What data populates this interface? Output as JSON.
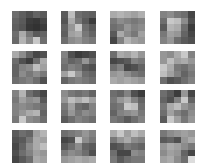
{
  "figure": {
    "rows": 4,
    "cols": 4,
    "tile_grid": [
      5,
      5
    ],
    "background": "#ffffff",
    "tile_positions": {
      "x": [
        12,
        61,
        110,
        160
      ],
      "y": [
        11,
        51,
        90,
        130
      ]
    },
    "tiles": [
      [
        [
          110,
          95,
          80,
          100,
          90
        ],
        [
          100,
          90,
          60,
          55,
          70
        ],
        [
          95,
          85,
          55,
          50,
          60
        ],
        [
          110,
          170,
          120,
          90,
          100
        ],
        [
          105,
          180,
          140,
          200,
          110
        ]
      ],
      [
        [
          90,
          190,
          110,
          100,
          95
        ],
        [
          85,
          170,
          120,
          90,
          60
        ],
        [
          100,
          150,
          200,
          110,
          90
        ],
        [
          95,
          160,
          170,
          120,
          100
        ],
        [
          110,
          140,
          150,
          130,
          120
        ]
      ],
      [
        [
          170,
          180,
          170,
          160,
          175
        ],
        [
          120,
          140,
          130,
          120,
          130
        ],
        [
          110,
          120,
          150,
          130,
          140
        ],
        [
          90,
          170,
          140,
          120,
          160
        ],
        [
          70,
          130,
          180,
          160,
          150
        ]
      ],
      [
        [
          130,
          140,
          120,
          110,
          70
        ],
        [
          110,
          200,
          190,
          140,
          80
        ],
        [
          90,
          180,
          170,
          110,
          60
        ],
        [
          120,
          160,
          150,
          100,
          70
        ],
        [
          130,
          150,
          110,
          90,
          80
        ]
      ],
      [
        [
          170,
          140,
          100,
          70,
          80
        ],
        [
          110,
          80,
          60,
          110,
          170
        ],
        [
          100,
          130,
          140,
          190,
          160
        ],
        [
          100,
          140,
          120,
          140,
          120
        ],
        [
          110,
          120,
          130,
          110,
          80
        ]
      ],
      [
        [
          130,
          80,
          60,
          70,
          80
        ],
        [
          120,
          100,
          110,
          150,
          110
        ],
        [
          110,
          130,
          120,
          90,
          80
        ],
        [
          160,
          200,
          150,
          110,
          100
        ],
        [
          100,
          120,
          130,
          120,
          110
        ]
      ],
      [
        [
          110,
          170,
          160,
          180,
          150
        ],
        [
          70,
          80,
          90,
          130,
          120
        ],
        [
          110,
          130,
          70,
          80,
          100
        ],
        [
          150,
          160,
          140,
          120,
          110
        ],
        [
          170,
          160,
          170,
          160,
          150
        ]
      ],
      [
        [
          150,
          140,
          170,
          200,
          130
        ],
        [
          150,
          190,
          160,
          170,
          150
        ],
        [
          200,
          170,
          120,
          110,
          130
        ],
        [
          190,
          160,
          130,
          100,
          120
        ],
        [
          110,
          80,
          90,
          110,
          130
        ]
      ],
      [
        [
          130,
          180,
          110,
          90,
          70
        ],
        [
          120,
          160,
          140,
          150,
          90
        ],
        [
          130,
          140,
          130,
          120,
          110
        ],
        [
          130,
          150,
          170,
          180,
          100
        ],
        [
          120,
          200,
          140,
          130,
          110
        ]
      ],
      [
        [
          140,
          120,
          110,
          120,
          100
        ],
        [
          150,
          190,
          170,
          190,
          160
        ],
        [
          120,
          160,
          110,
          100,
          130
        ],
        [
          110,
          150,
          120,
          140,
          130
        ],
        [
          90,
          110,
          130,
          120,
          110
        ]
      ],
      [
        [
          110,
          100,
          130,
          80,
          60
        ],
        [
          120,
          150,
          170,
          130,
          100
        ],
        [
          110,
          120,
          200,
          190,
          110
        ],
        [
          100,
          130,
          140,
          150,
          120
        ],
        [
          120,
          110,
          90,
          110,
          130
        ]
      ],
      [
        [
          110,
          90,
          60,
          150,
          70
        ],
        [
          100,
          80,
          130,
          200,
          100
        ],
        [
          120,
          170,
          190,
          150,
          130
        ],
        [
          110,
          160,
          130,
          110,
          140
        ],
        [
          90,
          200,
          160,
          120,
          150
        ]
      ],
      [
        [
          90,
          110,
          100,
          160,
          180
        ],
        [
          80,
          90,
          120,
          170,
          160
        ],
        [
          70,
          100,
          140,
          170,
          190
        ],
        [
          80,
          110,
          130,
          160,
          150
        ],
        [
          70,
          90,
          110,
          170,
          160
        ]
      ],
      [
        [
          110,
          120,
          130,
          150,
          130
        ],
        [
          70,
          80,
          200,
          140,
          120
        ],
        [
          90,
          110,
          140,
          100,
          90
        ],
        [
          120,
          140,
          130,
          110,
          80
        ],
        [
          150,
          160,
          170,
          160,
          170
        ]
      ],
      [
        [
          170,
          200,
          160,
          190,
          170
        ],
        [
          120,
          150,
          170,
          140,
          130
        ],
        [
          80,
          90,
          120,
          110,
          100
        ],
        [
          110,
          70,
          70,
          140,
          130
        ],
        [
          120,
          90,
          110,
          120,
          120
        ]
      ],
      [
        [
          120,
          140,
          150,
          160,
          150
        ],
        [
          90,
          100,
          80,
          150,
          170
        ],
        [
          150,
          170,
          160,
          140,
          120
        ],
        [
          140,
          160,
          150,
          100,
          70
        ],
        [
          160,
          170,
          140,
          110,
          220
        ]
      ]
    ]
  }
}
